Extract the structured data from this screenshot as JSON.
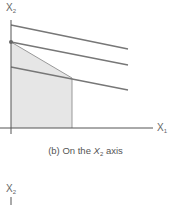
{
  "figure": {
    "caption_prefix": "(b) On the ",
    "caption_var": "X",
    "caption_sub": "2",
    "caption_suffix": " axis",
    "y_axis_label": "X",
    "y_axis_sub": "2",
    "x_axis_label": "X",
    "x_axis_sub": "1",
    "next_y_axis_label": "X",
    "next_y_axis_sub": "2",
    "colors": {
      "line": "#777777",
      "region_fill": "#e6e6e6",
      "axis": "#555555"
    },
    "objective_lines": 3,
    "optimal_point": "intersection on X2 axis"
  }
}
